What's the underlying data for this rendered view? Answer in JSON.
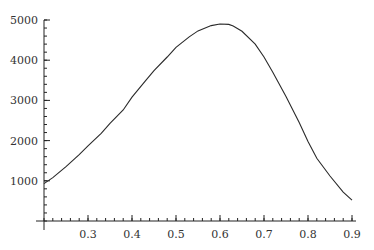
{
  "chart_data": {
    "type": "line",
    "title": "",
    "xlabel": "",
    "ylabel": "",
    "xlim": [
      0.2,
      0.9
    ],
    "ylim": [
      0,
      5000
    ],
    "grid": false,
    "legend": null,
    "x_ticks": [
      {
        "value": 0.3,
        "label": "0.3"
      },
      {
        "value": 0.4,
        "label": "0.4"
      },
      {
        "value": 0.5,
        "label": "0.5"
      },
      {
        "value": 0.6,
        "label": "0.6"
      },
      {
        "value": 0.7,
        "label": "0.7"
      },
      {
        "value": 0.8,
        "label": "0.8"
      },
      {
        "value": 0.9,
        "label": "0.9"
      }
    ],
    "y_ticks": [
      {
        "value": 1000,
        "label": "1000"
      },
      {
        "value": 2000,
        "label": "2000"
      },
      {
        "value": 3000,
        "label": "3000"
      },
      {
        "value": 4000,
        "label": "4000"
      },
      {
        "value": 5000,
        "label": "5000"
      }
    ],
    "series": [
      {
        "name": "curve",
        "x": [
          0.2,
          0.22,
          0.25,
          0.28,
          0.3,
          0.33,
          0.35,
          0.38,
          0.4,
          0.43,
          0.45,
          0.48,
          0.5,
          0.53,
          0.55,
          0.58,
          0.6,
          0.62,
          0.63,
          0.65,
          0.68,
          0.7,
          0.72,
          0.75,
          0.78,
          0.8,
          0.82,
          0.85,
          0.88,
          0.9
        ],
        "y": [
          930,
          1080,
          1350,
          1650,
          1870,
          2180,
          2430,
          2760,
          3080,
          3480,
          3740,
          4080,
          4320,
          4580,
          4730,
          4860,
          4900,
          4890,
          4850,
          4720,
          4400,
          4080,
          3700,
          3100,
          2450,
          1980,
          1560,
          1120,
          720,
          520
        ]
      }
    ]
  }
}
